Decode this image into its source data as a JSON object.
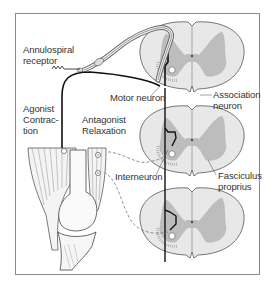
{
  "figure": {
    "type": "anatomical-diagram"
  },
  "labels": {
    "annulospiral_receptor": "Annulospiral\nreceptor",
    "agonist": "Agonist\nContrac-\ntion",
    "antagonist": "Antagonist\nRelaxation",
    "motor_neuron": "Motor neuron",
    "association_neuron": "Association\nneuron",
    "interneuron": "Interneuron",
    "fasciculus_proprius": "Fasciculus\nproprius"
  },
  "spinal_sections": [
    {
      "name": "upper-segment",
      "cx": 192,
      "cy": 56
    },
    {
      "name": "middle-segment",
      "cx": 192,
      "cy": 140
    },
    {
      "name": "lower-segment",
      "cx": 192,
      "cy": 222
    }
  ],
  "colors": {
    "frame": "#8a8a8a",
    "white_matter": "#e6e6e6",
    "gray_matter": "#b8b8b8",
    "neuron_line": "#111111",
    "text": "#333333",
    "dashed_inhibitory": "#777777"
  },
  "symbols": {
    "inhibitory_synapse": "⊖",
    "excitatory_synapse": "⊕"
  }
}
